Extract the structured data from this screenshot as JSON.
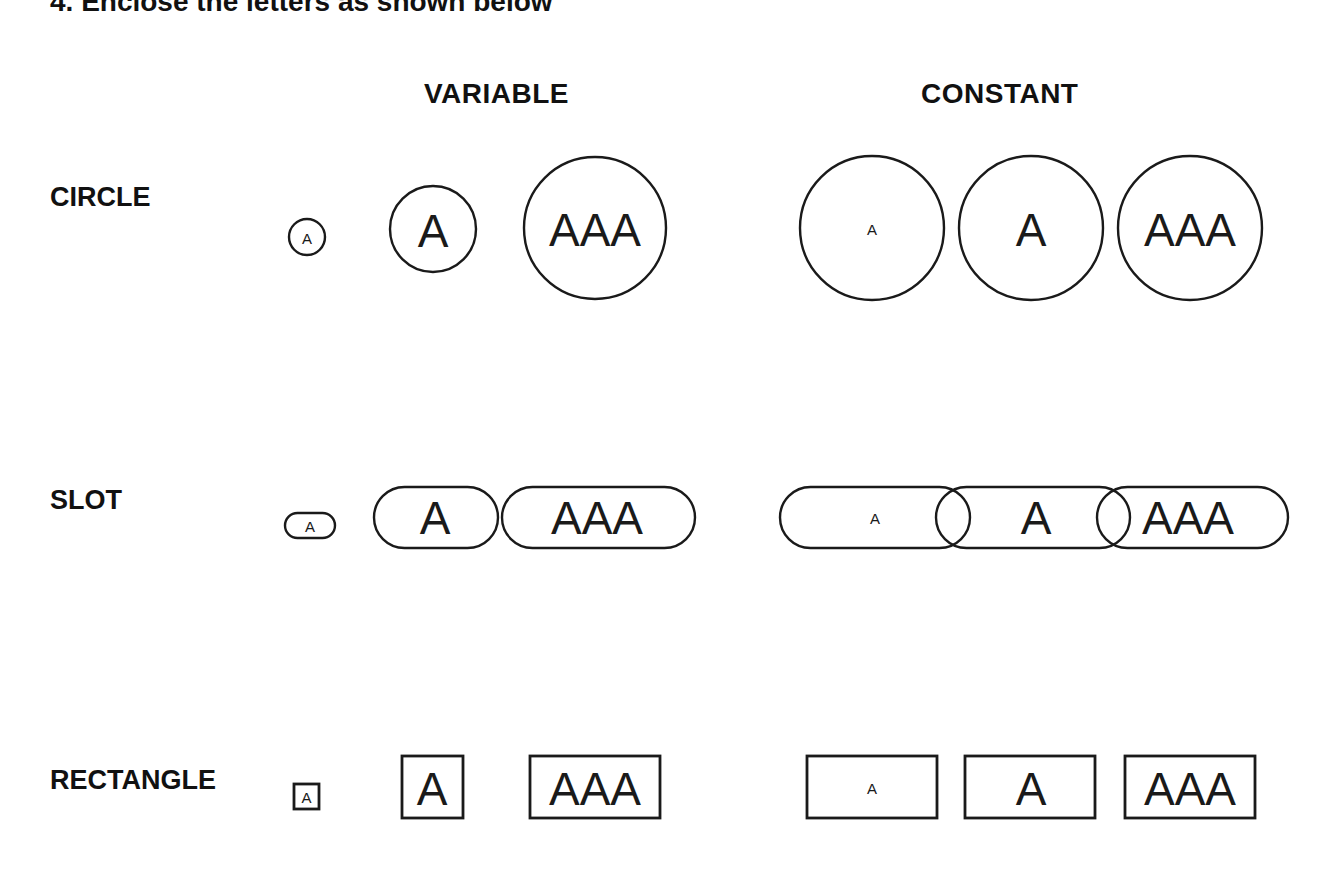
{
  "instruction": "4. Enclose the letters as shown below",
  "columns": {
    "variable": "VARIABLE",
    "constant": "CONSTANT"
  },
  "rows": [
    {
      "label": "CIRCLE",
      "variable": [
        {
          "text": "A",
          "size": "small"
        },
        {
          "text": "A",
          "size": "medium"
        },
        {
          "text": "AAA",
          "size": "large"
        }
      ],
      "constant": [
        {
          "text": "A",
          "size": "small"
        },
        {
          "text": "A",
          "size": "medium"
        },
        {
          "text": "AAA",
          "size": "large"
        }
      ]
    },
    {
      "label": "SLOT",
      "variable": [
        {
          "text": "A",
          "size": "small"
        },
        {
          "text": "A",
          "size": "medium"
        },
        {
          "text": "AAA",
          "size": "large"
        }
      ],
      "constant": [
        {
          "text": "A",
          "size": "small"
        },
        {
          "text": "A",
          "size": "medium"
        },
        {
          "text": "AAA",
          "size": "large"
        }
      ]
    },
    {
      "label": "RECTANGLE",
      "variable": [
        {
          "text": "A",
          "size": "small"
        },
        {
          "text": "A",
          "size": "medium"
        },
        {
          "text": "AAA",
          "size": "large"
        }
      ],
      "constant": [
        {
          "text": "A",
          "size": "small"
        },
        {
          "text": "A",
          "size": "medium"
        },
        {
          "text": "AAA",
          "size": "large"
        }
      ]
    }
  ],
  "colors": {
    "stroke": "#1a1a1a",
    "background": "#ffffff"
  }
}
